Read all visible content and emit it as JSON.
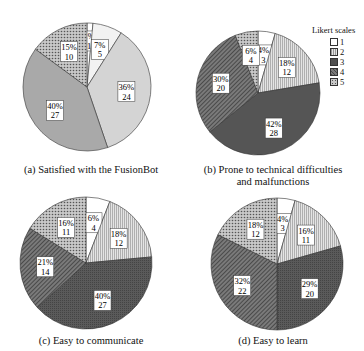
{
  "legend": {
    "title": "Likert scales",
    "items": [
      {
        "label": "1",
        "color": "#ffffff"
      },
      {
        "label": "2",
        "color": "#dcdcdc"
      },
      {
        "label": "3",
        "color": "#555555"
      },
      {
        "label": "4",
        "color": "#787878"
      },
      {
        "label": "5",
        "color": "#9a9a9a"
      }
    ]
  },
  "chart_data": [
    {
      "type": "pie",
      "title": "(a) Satisfied with the FusionBot",
      "categories": [
        "1",
        "2",
        "3",
        "4",
        "5"
      ],
      "values": [
        1,
        5,
        24,
        27,
        10
      ],
      "percent_labels": [
        "1%",
        "7%",
        "36%",
        "40%",
        "15%"
      ],
      "colors": [
        "#ffffff",
        "#f0f0f0",
        "#d2d2d2",
        "#a8a8a8",
        "#c4c4c4"
      ]
    },
    {
      "type": "pie",
      "title": "(b) Prone to technical difficulties and malfunctions",
      "categories": [
        "1",
        "2",
        "3",
        "4",
        "5"
      ],
      "values": [
        3,
        12,
        28,
        20,
        4
      ],
      "percent_labels": [
        "4%",
        "18%",
        "42%",
        "30%",
        "6%"
      ],
      "colors": [
        "#ffffff",
        "#dcdcdc",
        "#555555",
        "#707070",
        "#9a9a9a"
      ]
    },
    {
      "type": "pie",
      "title": "(c) Easy to communicate",
      "categories": [
        "1",
        "2",
        "3",
        "4",
        "5"
      ],
      "values": [
        4,
        12,
        27,
        14,
        11
      ],
      "percent_labels": [
        "6%",
        "18%",
        "40%",
        "21%",
        "16%"
      ],
      "colors": [
        "#ffffff",
        "#dcdcdc",
        "#555555",
        "#7a7a7a",
        "#9a9a9a"
      ]
    },
    {
      "type": "pie",
      "title": "(d) Easy to learn",
      "categories": [
        "1",
        "2",
        "3",
        "4",
        "5"
      ],
      "values": [
        3,
        11,
        20,
        22,
        12
      ],
      "percent_labels": [
        "4%",
        "16%",
        "29%",
        "32%",
        "18%"
      ],
      "colors": [
        "#ffffff",
        "#dcdcdc",
        "#5e5e5e",
        "#7a7a7a",
        "#9a9a9a"
      ]
    }
  ],
  "captions": {
    "a": "(a) Satisfied with the FusionBot",
    "b_line1": "(b) Prone to technical difficulties",
    "b_line2": "and malfunctions",
    "c": "(c) Easy to communicate",
    "d": "(d) Easy to learn"
  },
  "layout": {
    "pies": [
      {
        "cx": 87,
        "cy": 87,
        "r": 64
      },
      {
        "cx": 258,
        "cy": 93,
        "r": 62
      },
      {
        "cx": 86,
        "cy": 263,
        "r": 66
      },
      {
        "cx": 277,
        "cy": 264,
        "r": 66
      }
    ]
  }
}
